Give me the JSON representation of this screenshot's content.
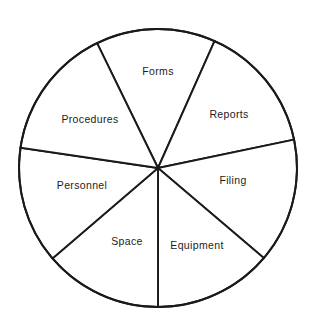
{
  "figure": {
    "type": "pie-diagram",
    "title": "",
    "background_color": "#ffffff",
    "stroke_color": "#1a1a1a",
    "label_color": "#1c1c1c"
  },
  "chart_data": {
    "type": "pie",
    "title": "",
    "xlabel": "",
    "ylabel": "",
    "grid": false,
    "legend": "none",
    "labels_inside": true,
    "center_x": 158,
    "center_y": 168,
    "radius": 139,
    "categories": [
      "Forms",
      "Reports",
      "Filing",
      "Equipment",
      "Space",
      "Personnel",
      "Procedures"
    ],
    "start_angles_deg": [
      66.0,
      11.8,
      -40.4,
      -90.0,
      -139.4,
      171.6,
      116.0
    ],
    "end_angles_deg": [
      116.0,
      66.0,
      11.8,
      -40.4,
      -90.0,
      -139.4,
      171.6
    ],
    "values": [
      50.0,
      54.2,
      52.2,
      49.6,
      49.4,
      48.6,
      55.6
    ],
    "slices": [
      {
        "label": "Forms",
        "start_deg": 66.0,
        "end_deg": 116.0,
        "sweep_deg": 50.0,
        "label_x": 158,
        "label_y": 72
      },
      {
        "label": "Reports",
        "start_deg": 11.8,
        "end_deg": 66.0,
        "sweep_deg": 54.2,
        "label_x": 229,
        "label_y": 115
      },
      {
        "label": "Filing",
        "start_deg": -40.4,
        "end_deg": 11.8,
        "sweep_deg": 52.2,
        "label_x": 233,
        "label_y": 181
      },
      {
        "label": "Equipment",
        "start_deg": -90.0,
        "end_deg": -40.4,
        "sweep_deg": 49.6,
        "label_x": 197,
        "label_y": 246
      },
      {
        "label": "Space",
        "start_deg": -139.4,
        "end_deg": -90.0,
        "sweep_deg": 49.4,
        "label_x": 127,
        "label_y": 242
      },
      {
        "label": "Personnel",
        "start_deg": 171.6,
        "end_deg": -139.4,
        "sweep_deg": 48.6,
        "label_x": 82,
        "label_y": 186
      },
      {
        "label": "Procedures",
        "start_deg": 116.0,
        "end_deg": 171.6,
        "sweep_deg": 55.6,
        "label_x": 90,
        "label_y": 120
      }
    ]
  }
}
